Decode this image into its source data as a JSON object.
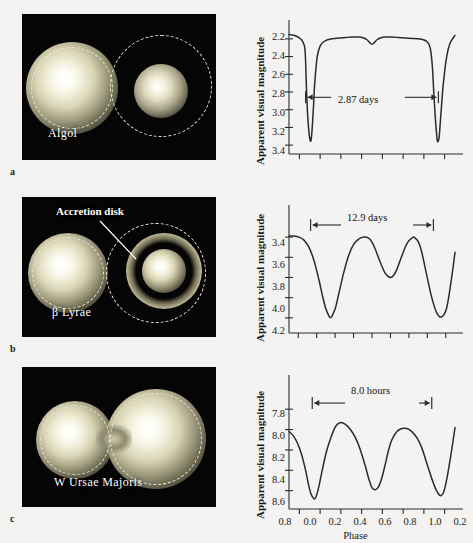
{
  "figure": {
    "background": "#f4f3f1",
    "curve_color": "#2b2b2b",
    "axis_color": "#2b2b2b",
    "xaxis_title": "Phase"
  },
  "panels": [
    {
      "letter": "a",
      "photo": {
        "star_name": "Algol",
        "annotation": null,
        "type": "semidetached"
      },
      "chart_data": {
        "type": "line",
        "title": "Algol light curve",
        "xlabel": "Phase",
        "ylabel": "Apparent visual magnitude",
        "ylim": [
          2.1,
          3.5
        ],
        "yticks": [
          "2.2",
          "2.4",
          "2.6",
          "2.8",
          "3.0",
          "3.2",
          "3.4"
        ],
        "ytick_values": [
          2.2,
          2.4,
          2.6,
          2.8,
          3.0,
          3.2,
          3.4
        ],
        "xticks": [],
        "n_xticks": 8,
        "grid": false,
        "period_label": "2.87 days",
        "period_days": 2.87,
        "annotation_y": 2.86,
        "annotation_x_start": 0.1,
        "annotation_x_end": 0.9,
        "x": [
          0.0,
          0.015,
          0.03,
          0.045,
          0.06,
          0.075,
          0.085,
          0.095,
          0.1,
          0.105,
          0.112,
          0.12,
          0.128,
          0.134,
          0.14,
          0.148,
          0.155,
          0.17,
          0.19,
          0.22,
          0.26,
          0.3,
          0.34,
          0.38,
          0.42,
          0.45,
          0.47,
          0.485,
          0.5,
          0.515,
          0.53,
          0.55,
          0.58,
          0.62,
          0.66,
          0.7,
          0.74,
          0.78,
          0.81,
          0.83,
          0.845,
          0.855,
          0.865,
          0.872,
          0.88,
          0.888,
          0.895,
          0.905,
          0.915,
          0.93,
          0.95,
          0.97,
          1.0
        ],
        "y": [
          2.15,
          2.155,
          2.16,
          2.17,
          2.185,
          2.21,
          2.24,
          2.3,
          2.45,
          2.75,
          3.05,
          3.25,
          3.35,
          3.33,
          3.2,
          2.95,
          2.7,
          2.4,
          2.27,
          2.22,
          2.2,
          2.19,
          2.185,
          2.18,
          2.18,
          2.19,
          2.21,
          2.24,
          2.26,
          2.24,
          2.21,
          2.19,
          2.18,
          2.18,
          2.185,
          2.19,
          2.195,
          2.2,
          2.21,
          2.23,
          2.27,
          2.35,
          2.55,
          2.8,
          3.05,
          3.25,
          3.36,
          3.3,
          3.05,
          2.7,
          2.4,
          2.25,
          2.16
        ]
      }
    },
    {
      "letter": "b",
      "photo": {
        "star_name": "β Lyrae",
        "annotation": "Accretion disk",
        "type": "semidetached-with-disk"
      },
      "chart_data": {
        "type": "line",
        "title": "Beta Lyrae light curve",
        "xlabel": "Phase",
        "ylabel": "Apparent visual magnitude",
        "ylim": [
          3.3,
          4.35
        ],
        "yticks": [
          "3.4",
          "3.6",
          "3.8",
          "4.0",
          "4.2"
        ],
        "ytick_values": [
          3.4,
          3.6,
          3.8,
          4.0,
          4.2
        ],
        "xticks": [],
        "n_xticks": 9,
        "grid": false,
        "period_label": "12.9 days",
        "period_days": 12.9,
        "annotation_y": 3.28,
        "annotation_x_start": 0.13,
        "annotation_x_end": 0.87,
        "x": [
          0.0,
          0.03,
          0.06,
          0.09,
          0.12,
          0.15,
          0.18,
          0.2,
          0.22,
          0.24,
          0.25,
          0.26,
          0.28,
          0.3,
          0.33,
          0.36,
          0.39,
          0.42,
          0.45,
          0.48,
          0.5,
          0.52,
          0.55,
          0.58,
          0.61,
          0.63,
          0.65,
          0.67,
          0.7,
          0.72,
          0.74,
          0.75,
          0.76,
          0.78,
          0.8,
          0.83,
          0.86,
          0.89,
          0.92,
          0.95,
          0.98,
          1.0
        ],
        "y": [
          3.39,
          3.39,
          3.4,
          3.43,
          3.5,
          3.63,
          3.82,
          3.97,
          4.1,
          4.18,
          4.2,
          4.18,
          4.1,
          3.96,
          3.75,
          3.58,
          3.47,
          3.42,
          3.4,
          3.41,
          3.45,
          3.52,
          3.65,
          3.76,
          3.8,
          3.78,
          3.72,
          3.63,
          3.5,
          3.44,
          3.41,
          3.4,
          3.41,
          3.45,
          3.55,
          3.78,
          4.0,
          4.15,
          4.19,
          4.1,
          3.8,
          3.55
        ]
      }
    },
    {
      "letter": "c",
      "photo": {
        "star_name": "W Ursae Majoris",
        "annotation": null,
        "type": "contact"
      },
      "chart_data": {
        "type": "line",
        "title": "W Ursae Majoris light curve",
        "xlabel": "Phase",
        "ylabel": "Apparent visual magnitude",
        "ylim": [
          7.7,
          8.78
        ],
        "yticks": [
          "7.8",
          "8.0",
          "8.2",
          "8.4",
          "8.6"
        ],
        "ytick_values": [
          7.8,
          8.0,
          8.2,
          8.4,
          8.6
        ],
        "xticks": [
          "0.8",
          "0.0",
          "0.2",
          "0.4",
          "0.6",
          "0.8",
          "1.0",
          "0.2"
        ],
        "xtick_values": [
          0.8,
          0.0,
          0.2,
          0.4,
          0.6,
          0.8,
          1.0,
          0.2
        ],
        "n_xticks": 8,
        "grid": false,
        "period_label": "8.0 hours",
        "period_hours": 8.0,
        "annotation_y": 7.74,
        "annotation_x_start": 0.14,
        "annotation_x_end": 0.86,
        "x": [
          0.0,
          0.025,
          0.05,
          0.075,
          0.1,
          0.115,
          0.13,
          0.145,
          0.155,
          0.165,
          0.18,
          0.2,
          0.225,
          0.25,
          0.28,
          0.31,
          0.34,
          0.37,
          0.4,
          0.43,
          0.46,
          0.48,
          0.5,
          0.52,
          0.54,
          0.56,
          0.58,
          0.6,
          0.62,
          0.65,
          0.68,
          0.71,
          0.74,
          0.77,
          0.8,
          0.83,
          0.86,
          0.88,
          0.9,
          0.915,
          0.93,
          0.945,
          0.96,
          0.98,
          1.0
        ],
        "y": [
          8.02,
          8.06,
          8.13,
          8.24,
          8.4,
          8.52,
          8.62,
          8.67,
          8.68,
          8.65,
          8.56,
          8.4,
          8.22,
          8.09,
          7.97,
          7.93,
          7.95,
          8.0,
          8.08,
          8.2,
          8.36,
          8.48,
          8.57,
          8.59,
          8.56,
          8.47,
          8.34,
          8.2,
          8.1,
          8.02,
          7.99,
          7.99,
          8.02,
          8.08,
          8.18,
          8.33,
          8.48,
          8.57,
          8.63,
          8.65,
          8.62,
          8.53,
          8.4,
          8.2,
          7.98
        ]
      }
    }
  ]
}
